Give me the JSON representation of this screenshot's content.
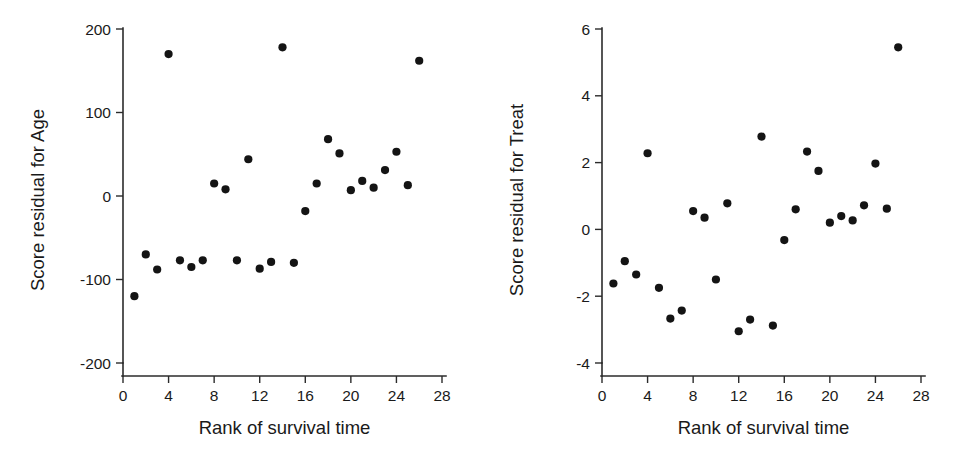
{
  "figure": {
    "background": "#ffffff",
    "point_color": "#141414",
    "axis_color": "#2b2b2b",
    "panel_count": 2
  },
  "chart_data": [
    {
      "type": "scatter",
      "panel": "left",
      "title": "",
      "xlabel": "Rank of survival time",
      "ylabel": "Score residual for Age",
      "xlim": [
        0,
        28
      ],
      "ylim": [
        -200,
        200
      ],
      "xticks": [
        0,
        4,
        8,
        12,
        16,
        20,
        24,
        28
      ],
      "yticks": [
        -200,
        -100,
        0,
        100,
        200
      ],
      "xtick_labels": [
        "0",
        "4",
        "8",
        "12",
        "16",
        "20",
        "24",
        "28"
      ],
      "ytick_labels": [
        "-200",
        "-100",
        "0",
        "100",
        "200"
      ],
      "grid": false,
      "legend": false,
      "x": [
        1,
        2,
        3,
        4,
        5,
        6,
        7,
        8,
        9,
        10,
        11,
        12,
        13,
        14,
        15,
        16,
        17,
        18,
        19,
        20,
        21,
        22,
        23,
        24,
        25,
        26
      ],
      "y": [
        -120,
        -70,
        -88,
        170,
        -77,
        -85,
        -77,
        15,
        8,
        -77,
        44,
        -87,
        -79,
        178,
        -80,
        -18,
        15,
        68,
        51,
        7,
        18,
        10,
        31,
        53,
        13,
        162
      ]
    },
    {
      "type": "scatter",
      "panel": "right",
      "title": "",
      "xlabel": "Rank of survival time",
      "ylabel": "Score residual for Treat",
      "xlim": [
        0,
        28
      ],
      "ylim": [
        -4,
        6
      ],
      "xticks": [
        0,
        4,
        8,
        12,
        16,
        20,
        24,
        28
      ],
      "yticks": [
        -4,
        -2,
        0,
        2,
        4,
        6
      ],
      "xtick_labels": [
        "0",
        "4",
        "8",
        "12",
        "16",
        "20",
        "24",
        "28"
      ],
      "ytick_labels": [
        "-4",
        "-2",
        "0",
        "2",
        "4",
        "6"
      ],
      "grid": false,
      "legend": false,
      "x": [
        1,
        2,
        3,
        4,
        5,
        6,
        7,
        8,
        9,
        10,
        11,
        12,
        13,
        14,
        15,
        16,
        17,
        18,
        19,
        20,
        21,
        22,
        23,
        24,
        25,
        26
      ],
      "y": [
        -1.62,
        -0.95,
        -1.35,
        2.28,
        -1.75,
        -2.67,
        -2.43,
        0.55,
        0.35,
        -1.5,
        0.78,
        -3.05,
        -2.7,
        2.78,
        -2.88,
        -0.32,
        0.6,
        2.33,
        1.75,
        0.2,
        0.4,
        0.27,
        0.72,
        1.97,
        0.62,
        5.45
      ]
    }
  ]
}
